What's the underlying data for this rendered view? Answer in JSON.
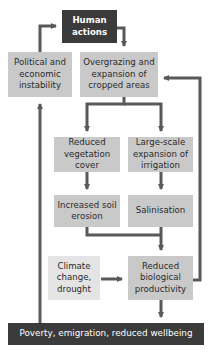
{
  "diagram": {
    "nodes": {
      "human_actions": "Human\nactions",
      "political": "Political and\neconomic\ninstability",
      "overgrazing": "Overgrazing and\nexpansion of\ncropped areas",
      "reduced_vegetation": "Reduced\nvegetation\ncover",
      "irrigation": "Large-scale\nexpansion of\nirrigation",
      "soil_erosion": "Increased soil\nerosion",
      "salinisation": "Salinisation",
      "climate": "Climate\nchange,\ndrought",
      "reduced_productivity": "Reduced\nbiological\nproductivity",
      "poverty": "Poverty, emigration, reduced wellbeing"
    },
    "edges": [
      {
        "from": "political",
        "to": "human_actions"
      },
      {
        "from": "human_actions",
        "to": "overgrazing"
      },
      {
        "from": "overgrazing",
        "to": "reduced_vegetation"
      },
      {
        "from": "overgrazing",
        "to": "irrigation"
      },
      {
        "from": "reduced_vegetation",
        "to": "soil_erosion"
      },
      {
        "from": "irrigation",
        "to": "salinisation"
      },
      {
        "from": "soil_erosion",
        "to": "reduced_productivity"
      },
      {
        "from": "salinisation",
        "to": "reduced_productivity"
      },
      {
        "from": "climate",
        "to": "reduced_productivity"
      },
      {
        "from": "reduced_productivity",
        "to": "overgrazing"
      },
      {
        "from": "reduced_productivity",
        "to": "poverty"
      },
      {
        "from": "poverty",
        "to": "political"
      }
    ],
    "colors": {
      "dark": "#3b3b3b",
      "mid": "#c9c9c9",
      "light": "#e4e4e4",
      "arrow": "#595959"
    }
  }
}
